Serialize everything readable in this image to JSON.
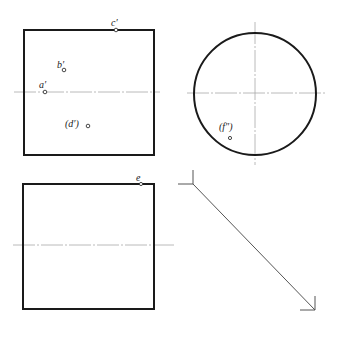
{
  "drawing": {
    "type": "orthographic projection (three views)",
    "views": {
      "front": {
        "shape": "square",
        "points": [
          {
            "id": "c",
            "label": "c′"
          },
          {
            "id": "b",
            "label": "b′"
          },
          {
            "id": "a",
            "label": "a′"
          },
          {
            "id": "d",
            "label": "(d′)"
          }
        ]
      },
      "side": {
        "shape": "circle",
        "points": [
          {
            "id": "f",
            "label": "(f″)"
          }
        ]
      },
      "top": {
        "shape": "square",
        "points": [
          {
            "id": "e",
            "label": "e"
          }
        ]
      },
      "miter": {
        "shape": "45-degree construction line"
      }
    }
  },
  "colors": {
    "outline": "#1a1a1a",
    "centerline": "#a8a8a8",
    "construction": "#555555"
  }
}
